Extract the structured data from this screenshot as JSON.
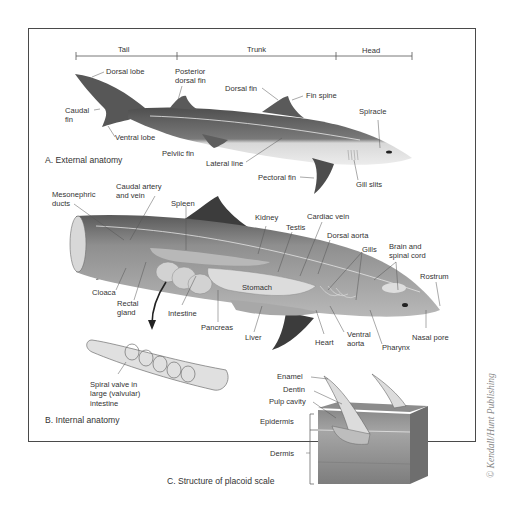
{
  "figure": {
    "body_regions": {
      "tail": "Tail",
      "trunk": "Trunk",
      "head": "Head"
    },
    "external": {
      "title": "A. External anatomy",
      "labels": {
        "dorsal_lobe": "Dorsal lobe",
        "posterior_dorsal_fin": "Posterior\ndorsal fin",
        "dorsal_fin": "Dorsal fin",
        "fin_spine": "Fin spine",
        "spiracle": "Spiracle",
        "caudal_fin": "Caudal\nfin",
        "ventral_lobe": "Ventral lobe",
        "pelvic_fin": "Pelviic fin",
        "lateral_line": "Lateral line",
        "pectoral_fin": "Pectoral fin",
        "gill_slits": "Gill slits"
      }
    },
    "internal": {
      "title": "B. Internal anatomy",
      "labels": {
        "mesonephric_ducts": "Mesonephric\nducts",
        "caudal_artery_vein": "Caudal artery\nand vein",
        "spleen": "Spleen",
        "kidney": "Kidney",
        "cardiac_vein": "Cardiac vein",
        "testis": "Testis",
        "dorsal_aorta": "Dorsal aorta",
        "gills": "Gills",
        "brain_spinal_cord": "Brain and\nspinal cord",
        "rostrum": "Rostrum",
        "cloaca": "Cloaca",
        "stomach": "Stomach",
        "rectal_gland": "Rectal\ngland",
        "intestine": "Intestine",
        "pancreas": "Pancreas",
        "liver": "Liver",
        "heart": "Heart",
        "ventral_aorta": "Ventral\naorta",
        "pharynx": "Pharynx",
        "nasal_pore": "Nasal pore",
        "spiral_valve": "Spiral valve in\nlarge (valvular)\nintestine"
      }
    },
    "scale": {
      "title": "C. Structure of placoid scale",
      "labels": {
        "enamel": "Enamel",
        "dentin": "Dentin",
        "pulp_cavity": "Pulp cavity",
        "epidermis": "Epidermis",
        "dermis": "Dermis"
      }
    },
    "credit": "© Kendall/Hunt Publishing",
    "colors": {
      "frame": "#4a4a4a",
      "shark_dark": "#5e5e5e",
      "shark_light": "#d6d6d6",
      "organ": "#c9c9c9",
      "skin": "#9a9a9a",
      "text": "#333333"
    }
  }
}
